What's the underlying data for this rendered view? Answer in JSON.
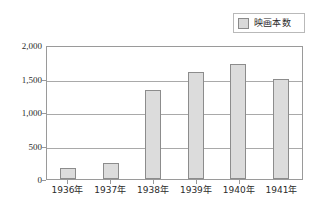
{
  "legend": {
    "swatch_icon": "legend-swatch-icon",
    "label": "映画本数",
    "color": "#d9d9d9",
    "border_color": "#8a8a8a"
  },
  "axis": {
    "y_ticks": [
      "2,000",
      "1,500",
      "1,000",
      "500",
      "0"
    ],
    "x_ticks": [
      "1936年",
      "1937年",
      "1938年",
      "1939年",
      "1940年",
      "1941年"
    ]
  },
  "chart_data": {
    "type": "bar",
    "title": "",
    "xlabel": "",
    "ylabel": "",
    "categories": [
      "1936年",
      "1937年",
      "1938年",
      "1939年",
      "1940年",
      "1941年"
    ],
    "values": [
      170,
      240,
      1350,
      1620,
      1750,
      1510
    ],
    "series": [
      {
        "name": "映画本数",
        "values": [
          170,
          240,
          1350,
          1620,
          1750,
          1510
        ],
        "color": "#dcdcdc"
      }
    ],
    "ylim": [
      0,
      2000
    ],
    "ytick_values": [
      2000,
      1500,
      1000,
      500,
      0
    ],
    "grid": true,
    "legend_position": "top-right"
  }
}
